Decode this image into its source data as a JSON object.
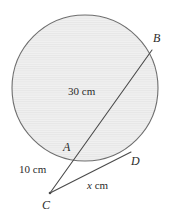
{
  "figure": {
    "name": "circle-secant-tangent-diagram",
    "background_color": "#ffffff",
    "width": 176,
    "height": 220
  },
  "circle": {
    "name": "shaded-circle",
    "center_x": 85,
    "center_y": 88,
    "radius": 73,
    "fill_color": "#efefef",
    "hatch_color": "#e3e3e3",
    "stroke_color": "#6e6e6e",
    "stroke_width": 1.1
  },
  "points": {
    "A": {
      "label": "A",
      "x": 76,
      "y": 160,
      "label_x": 63,
      "label_y": 141,
      "on_circle": true
    },
    "B": {
      "label": "B",
      "x": 152,
      "y": 50,
      "label_x": 153,
      "label_y": 32,
      "on_circle": true
    },
    "C": {
      "label": "C",
      "x": 50,
      "y": 193,
      "label_x": 42,
      "label_y": 199,
      "on_circle": false
    },
    "D": {
      "label": "D",
      "x": 128,
      "y": 155,
      "label_x": 131,
      "label_y": 155,
      "on_circle": true
    }
  },
  "segments": {
    "secant": {
      "name": "secant-line-c-a-b",
      "from": "C",
      "through": "A",
      "to": "B",
      "stroke_color": "#4a4a4a",
      "stroke_width": 1.1
    },
    "tangent": {
      "name": "tangent-line-c-d",
      "from": "C",
      "to": "D",
      "stroke_color": "#4a4a4a",
      "stroke_width": 1.1
    }
  },
  "labels": {
    "chord_ab": {
      "name": "length-label-ab",
      "text": "30 cm",
      "x": 68,
      "y": 86,
      "describes": "AB"
    },
    "segment_ca": {
      "name": "length-label-ca",
      "text": "10 cm",
      "x": 19,
      "y": 164,
      "describes": "CA"
    },
    "tangent_cd": {
      "name": "length-label-cd",
      "text_variable": "x",
      "text_unit": " cm",
      "x": 87,
      "y": 180,
      "describes": "CD"
    }
  },
  "chart_data": {
    "type": "diagram",
    "title": "",
    "annotations": [
      {
        "label": "30 cm",
        "segment": "AB"
      },
      {
        "label": "10 cm",
        "segment": "CA"
      },
      {
        "label": "x cm",
        "segment": "CD"
      }
    ],
    "vertices": [
      "A",
      "B",
      "C",
      "D"
    ]
  }
}
